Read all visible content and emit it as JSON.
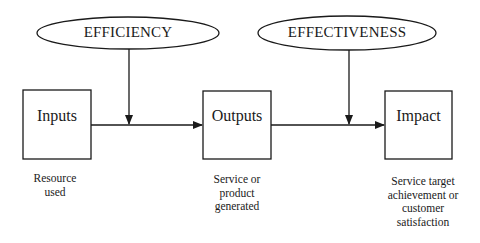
{
  "diagram": {
    "ellipses": [
      {
        "id": "efficiency",
        "label": "EFFICIENCY"
      },
      {
        "id": "effectiveness",
        "label": "EFFECTIVENESS"
      }
    ],
    "boxes": [
      {
        "id": "inputs",
        "label": "Inputs",
        "caption_lines": [
          "Resource",
          "used"
        ]
      },
      {
        "id": "outputs",
        "label": "Outputs",
        "caption_lines": [
          "Service or",
          "product",
          "generated"
        ]
      },
      {
        "id": "impact",
        "label": "Impact",
        "caption_lines": [
          "Service target",
          "achievement or",
          "customer",
          "satisfaction"
        ]
      }
    ],
    "flows": [
      {
        "from": "inputs",
        "to": "outputs"
      },
      {
        "from": "outputs",
        "to": "impact"
      },
      {
        "from": "efficiency",
        "to": "inputs-outputs-flow"
      },
      {
        "from": "effectiveness",
        "to": "outputs-impact-flow"
      }
    ],
    "colors": {
      "stroke": "#1a1a1a",
      "background": "#ffffff"
    }
  }
}
